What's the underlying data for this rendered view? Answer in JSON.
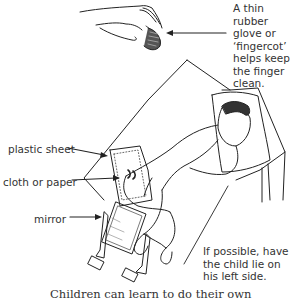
{
  "illustration": {
    "subject": "child lying on left side on a bed, with a gloved hand above and a mirror beside",
    "line_color": "#222222",
    "background": "#ffffff"
  },
  "annotations": {
    "glove_note": "A thin rubber glove or ‘fingercot’ helps keep the finger clean.",
    "plastic_sheet": "plastic sheet",
    "cloth_or_paper": "cloth or paper",
    "mirror": "mirror",
    "position_note": "If possible, have the child lie on his left side."
  },
  "caption": {
    "partial_text": "Children can learn to do their own"
  },
  "icons": {
    "hand": "gloved-hand-icon",
    "arrows": "pointer-arrow-icon"
  }
}
